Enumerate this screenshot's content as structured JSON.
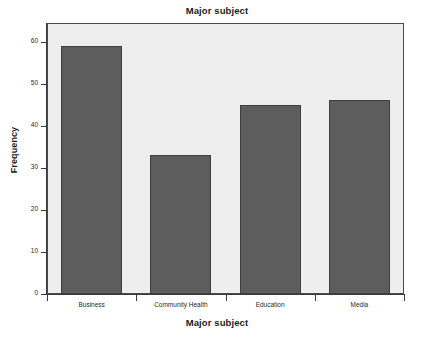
{
  "chart_data": {
    "type": "bar",
    "title": "Major subject",
    "xlabel": "Major subject",
    "ylabel": "Frequency",
    "categories": [
      "Business",
      "Community Health",
      "Education",
      "Media"
    ],
    "values": [
      59,
      33,
      45,
      46
    ],
    "ylim": [
      0,
      60
    ],
    "yticks": [
      0,
      10,
      20,
      30,
      40,
      50,
      60
    ],
    "ytick_labels": [
      "0",
      "10",
      "20",
      "30",
      "40",
      "50",
      "60"
    ],
    "grid": false,
    "legend": null,
    "bar_color": "#5d5d5d",
    "bar_edge_color": "#3f3f3f",
    "plot_background": "#eeeeee",
    "figure_background": "#ffffff",
    "axis_color": "#3a3a3a"
  }
}
